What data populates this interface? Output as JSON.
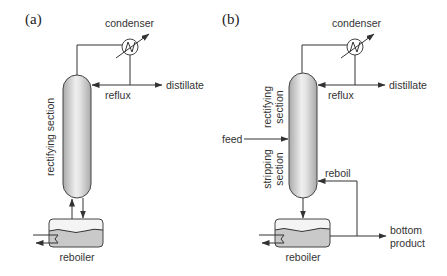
{
  "figure": {
    "panels": [
      {
        "label": "(a)",
        "condenser": "condenser",
        "reflux": "reflux",
        "distillate": "distillate",
        "section": "rectifying section",
        "reboiler": "reboiler"
      },
      {
        "label": "(b)",
        "condenser": "condenser",
        "reflux": "reflux",
        "distillate": "distillate",
        "rectifying_section": [
          "rectifying",
          "section"
        ],
        "stripping_section": [
          "stripping",
          "section"
        ],
        "feed": "feed",
        "reboil": "reboil",
        "bottom_product": [
          "bottom",
          "product"
        ],
        "reboiler": "reboiler"
      }
    ]
  },
  "colors": {
    "line": "#333333",
    "column_light": "#efefef",
    "column_dark": "#a9a9a9",
    "liquid": "#c9c9c9"
  }
}
